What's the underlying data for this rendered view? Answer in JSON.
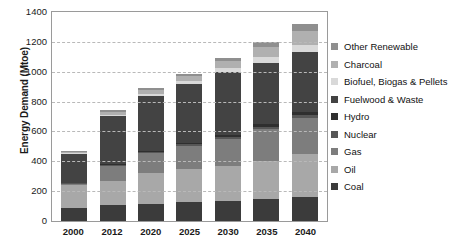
{
  "chart_data": {
    "type": "bar",
    "stacked": true,
    "title": "",
    "xlabel": "",
    "ylabel": "Energy Demand (Mtoe)",
    "ylim": [
      0,
      1400
    ],
    "ytick_step": 200,
    "yticks": [
      1400,
      1200,
      1000,
      800,
      600,
      400,
      200,
      0
    ],
    "grid": true,
    "grid_style": "dashed-horizontal",
    "legend_position": "right",
    "categories": [
      "2000",
      "2012",
      "2020",
      "2025",
      "2030",
      "2035",
      "2040"
    ],
    "series": [
      {
        "name": "Coal",
        "color": "#3b3b3b",
        "values": [
          88,
          105,
          115,
          128,
          135,
          150,
          163
        ]
      },
      {
        "name": "Oil",
        "color": "#a8a8a8",
        "values": [
          150,
          165,
          205,
          218,
          233,
          252,
          283
        ]
      },
      {
        "name": "Gas",
        "color": "#7d7d7d",
        "values": [
          10,
          100,
          135,
          157,
          182,
          212,
          243
        ]
      },
      {
        "name": "Nuclear",
        "color": "#575757",
        "values": [
          5,
          8,
          8,
          10,
          12,
          18,
          23
        ]
      },
      {
        "name": "Hydro",
        "color": "#2f2f2f",
        "values": [
          5,
          7,
          8,
          10,
          12,
          15,
          18
        ]
      },
      {
        "name": "Fuelwood & Waste",
        "color": "#434343",
        "values": [
          193,
          320,
          367,
          397,
          425,
          415,
          403
        ]
      },
      {
        "name": "Biofuel, Biogas & Pellets",
        "color": "#d9d9d9",
        "values": [
          4,
          8,
          12,
          18,
          25,
          35,
          48
        ]
      },
      {
        "name": "Charcoal",
        "color": "#b0b0b0",
        "values": [
          10,
          18,
          30,
          35,
          48,
          72,
          90
        ]
      },
      {
        "name": "Other Renewable",
        "color": "#8f8f8f",
        "values": [
          5,
          10,
          12,
          15,
          20,
          32,
          50
        ]
      }
    ],
    "totals": [
      470,
      741,
      892,
      988,
      1092,
      1201,
      1321
    ],
    "legend_entries": [
      {
        "label": "Other Renewable",
        "color": "#8f8f8f"
      },
      {
        "label": "Charcoal",
        "color": "#b0b0b0"
      },
      {
        "label": "Biofuel, Biogas & Pellets",
        "color": "#d9d9d9"
      },
      {
        "label": "Fuelwood & Waste",
        "color": "#434343"
      },
      {
        "label": "Hydro",
        "color": "#2f2f2f"
      },
      {
        "label": "Nuclear",
        "color": "#575757"
      },
      {
        "label": "Gas",
        "color": "#7d7d7d"
      },
      {
        "label": "Oil",
        "color": "#a8a8a8"
      },
      {
        "label": "Coal",
        "color": "#3b3b3b"
      }
    ]
  }
}
